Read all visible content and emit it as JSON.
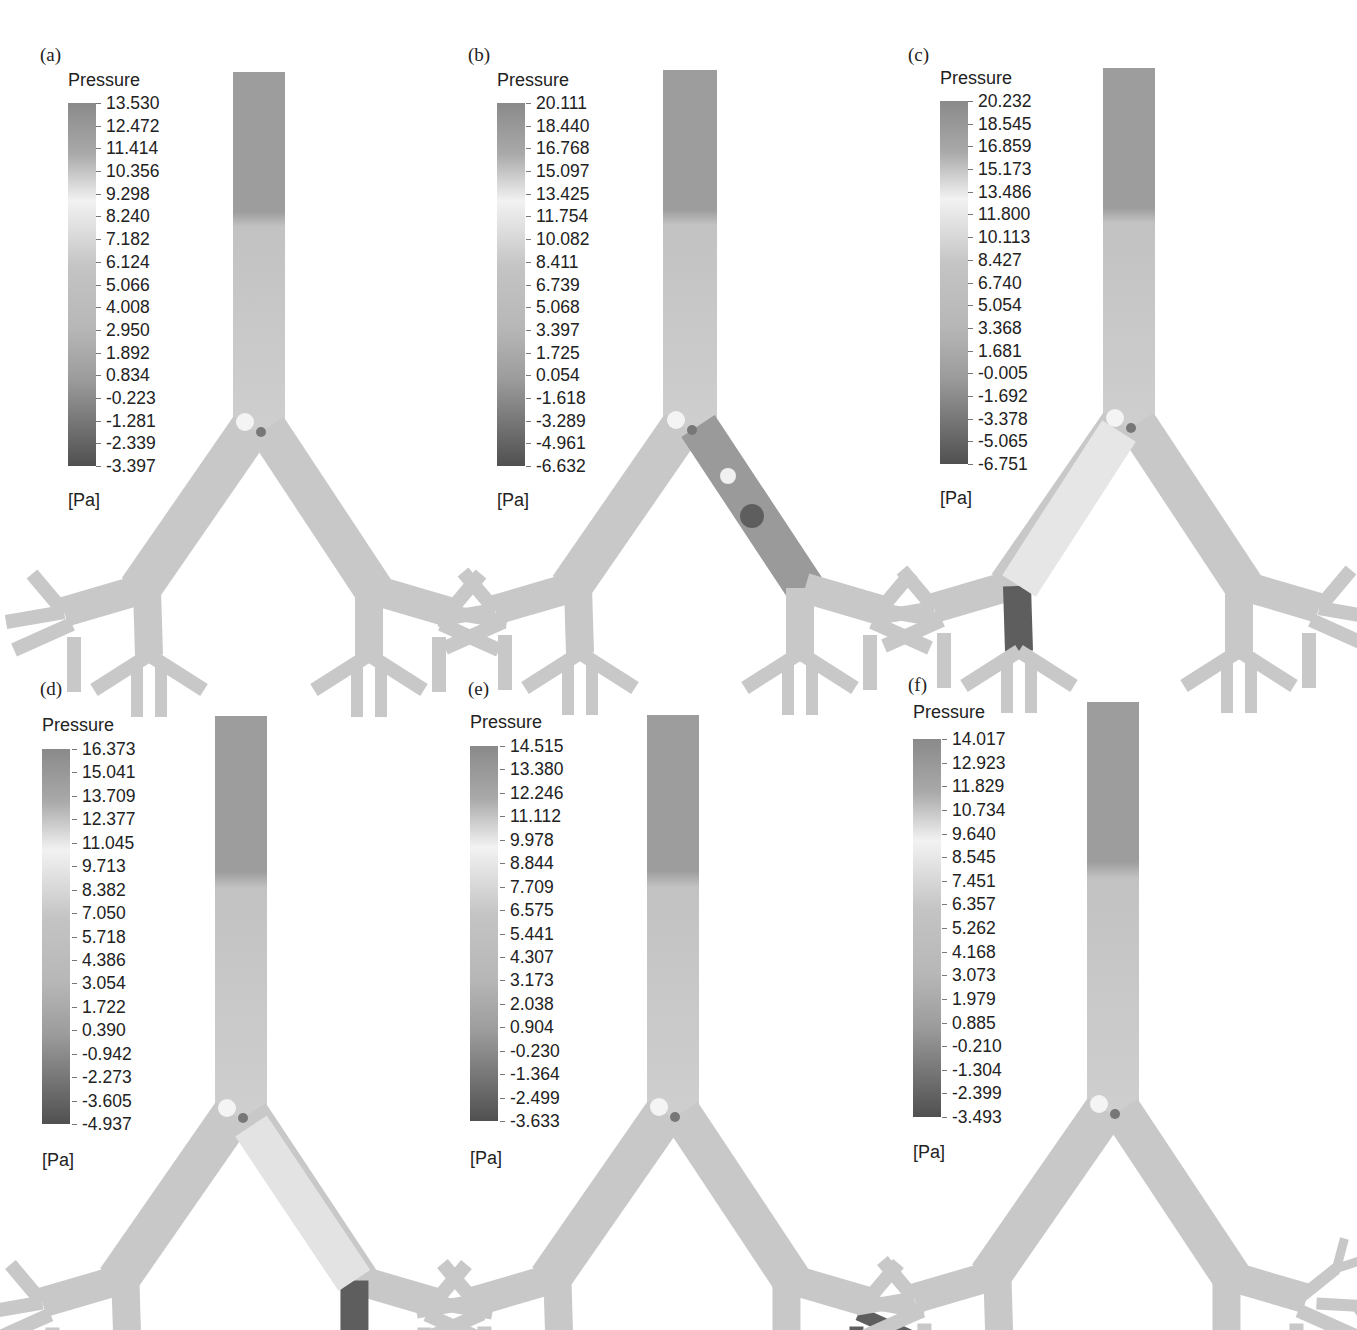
{
  "figure": {
    "quantity": "Pressure",
    "unit": "[Pa]",
    "panels": [
      {
        "label": "(a)",
        "legend_title": "Pressure",
        "unit": "[Pa]",
        "ticks": [
          "13.530",
          "12.472",
          "11.414",
          "10.356",
          "9.298",
          "8.240",
          "7.182",
          "6.124",
          "5.066",
          "4.008",
          "2.950",
          "1.892",
          "0.834",
          "-0.223",
          "-1.281",
          "-2.339",
          "-3.397"
        ],
        "note": "baseline airway tree"
      },
      {
        "label": "(b)",
        "legend_title": "Pressure",
        "unit": "[Pa]",
        "ticks": [
          "20.111",
          "18.440",
          "16.768",
          "15.097",
          "13.425",
          "11.754",
          "10.082",
          "8.411",
          "6.739",
          "5.068",
          "3.397",
          "1.725",
          "0.054",
          "-1.618",
          "-3.289",
          "-4.961",
          "-6.632"
        ],
        "note": "low-pressure region in right main bronchus"
      },
      {
        "label": "(c)",
        "legend_title": "Pressure",
        "unit": "[Pa]",
        "ticks": [
          "20.232",
          "18.545",
          "16.859",
          "15.173",
          "13.486",
          "11.800",
          "10.113",
          "8.427",
          "6.740",
          "5.054",
          "3.368",
          "1.681",
          "-0.005",
          "-1.692",
          "-3.378",
          "-5.065",
          "-6.751"
        ],
        "note": "low-pressure region in left lower branch"
      },
      {
        "label": "(d)",
        "legend_title": "Pressure",
        "unit": "[Pa]",
        "ticks": [
          "16.373",
          "15.041",
          "13.709",
          "12.377",
          "11.045",
          "9.713",
          "8.382",
          "7.050",
          "5.718",
          "4.386",
          "3.054",
          "1.722",
          "0.390",
          "-0.942",
          "-2.273",
          "-3.605",
          "-4.937"
        ],
        "note": "low-pressure region in right lower branch"
      },
      {
        "label": "(e)",
        "legend_title": "Pressure",
        "unit": "[Pa]",
        "ticks": [
          "14.515",
          "13.380",
          "12.246",
          "11.112",
          "9.978",
          "8.844",
          "7.709",
          "6.575",
          "5.441",
          "4.307",
          "3.173",
          "2.038",
          "0.904",
          "-0.230",
          "-1.364",
          "-2.499",
          "-3.633"
        ],
        "note": "low-pressure region in right outer branch"
      },
      {
        "label": "(f)",
        "legend_title": "Pressure",
        "unit": "[Pa]",
        "ticks": [
          "14.017",
          "12.923",
          "11.829",
          "10.734",
          "9.640",
          "8.545",
          "7.451",
          "6.357",
          "5.262",
          "4.168",
          "3.073",
          "1.979",
          "0.885",
          "-0.210",
          "-1.304",
          "-2.399",
          "-3.493"
        ],
        "note": "extra generation on right outer branch"
      }
    ]
  },
  "colors": {
    "colormap_top": "#8a8a8a",
    "colormap_high": "#a9a9a9",
    "colormap_light": "#f2f2f2",
    "colormap_mid": "#c4c4c4",
    "colormap_low": "#9c9c9c",
    "colormap_bottom": "#505050",
    "airway_fill": "#c8c8c8",
    "trachea_top": "#9d9d9d",
    "trachea_bottom": "#c2c2c2",
    "low_pressure": "#5e5e5e"
  }
}
